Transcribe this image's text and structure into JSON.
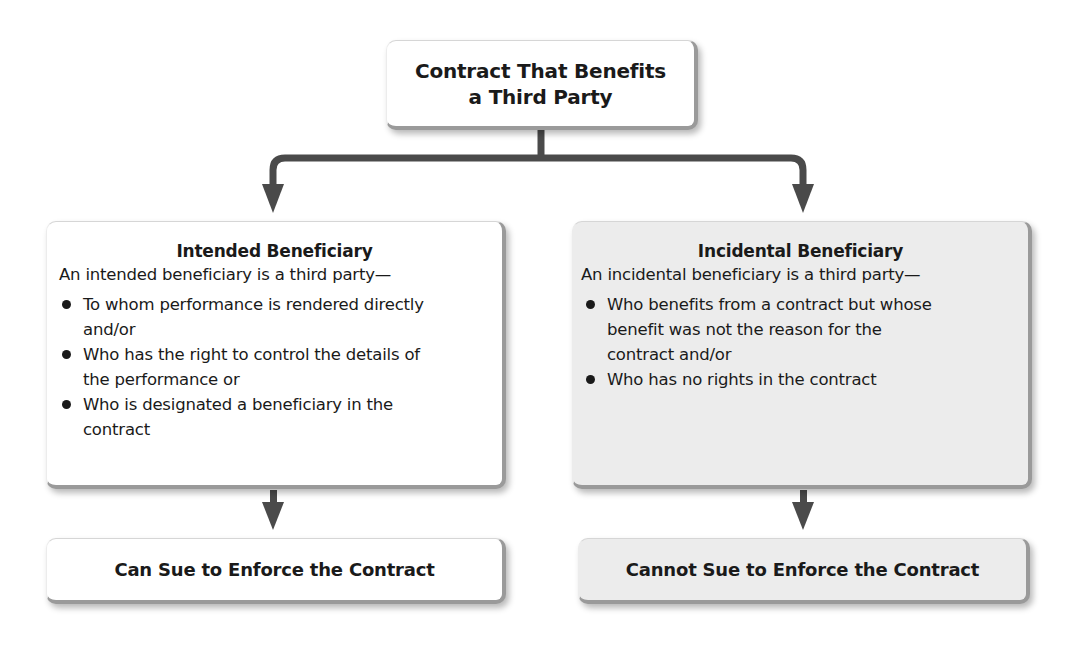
{
  "diagram": {
    "root": {
      "title_line1": "Contract That Benefits",
      "title_line2": "a Third Party"
    },
    "branches": [
      {
        "title": "Intended Beneficiary",
        "intro": "An intended beneficiary is a third party—",
        "bullets": [
          "To whom performance is rendered directly and/or",
          "Who has the right to control the details of the performance or",
          "Who is designated a beneficiary in the contract"
        ],
        "outcome": "Can Sue to Enforce the Contract",
        "shaded": false
      },
      {
        "title": "Incidental Beneficiary",
        "intro": "An incidental beneficiary is a third party—",
        "bullets": [
          "Who benefits from a contract but whose benefit was not the reason for the contract and/or",
          "Who has no rights in the contract"
        ],
        "outcome": "Cannot Sue to Enforce the Contract",
        "shaded": true
      }
    ],
    "colors": {
      "connector": "#4a4a4a",
      "box_border": "#9a9a9a",
      "shaded_fill": "#ececec",
      "text": "#1a1a1a"
    },
    "icons": {
      "bullet": "bullet-dot-icon",
      "arrow": "arrow-down-icon"
    }
  }
}
